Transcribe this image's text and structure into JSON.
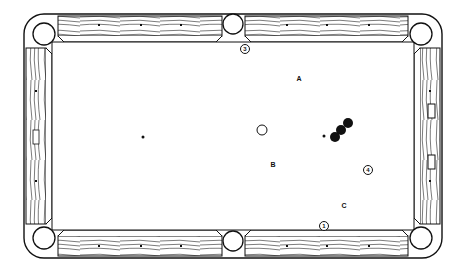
{
  "diagram": {
    "type": "pool-table-shot-diagram",
    "labels": [
      {
        "id": "A",
        "text": "A",
        "x": 299,
        "y": 78
      },
      {
        "id": "B",
        "text": "B",
        "x": 273,
        "y": 164
      },
      {
        "id": "C",
        "text": "C",
        "x": 344,
        "y": 205
      }
    ],
    "numbered_markers": [
      {
        "id": "1",
        "text": "1",
        "x": 324,
        "y": 226
      },
      {
        "id": "3",
        "text": "3",
        "x": 245,
        "y": 49
      },
      {
        "id": "4",
        "text": "4",
        "x": 368,
        "y": 170
      }
    ],
    "balls": {
      "cue_ball": {
        "x": 262,
        "y": 130,
        "r": 5,
        "fill": "#ffffff",
        "stroke": "#111111"
      },
      "object_balls": [
        {
          "x": 348,
          "y": 123,
          "r": 5
        },
        {
          "x": 341,
          "y": 130,
          "r": 5
        },
        {
          "x": 335,
          "y": 137,
          "r": 5
        }
      ]
    },
    "spots": [
      {
        "x": 143,
        "y": 137,
        "r": 1.6
      },
      {
        "x": 324,
        "y": 136,
        "r": 1.4
      }
    ],
    "colors": {
      "ink": "#111111",
      "paper": "#ffffff"
    }
  }
}
